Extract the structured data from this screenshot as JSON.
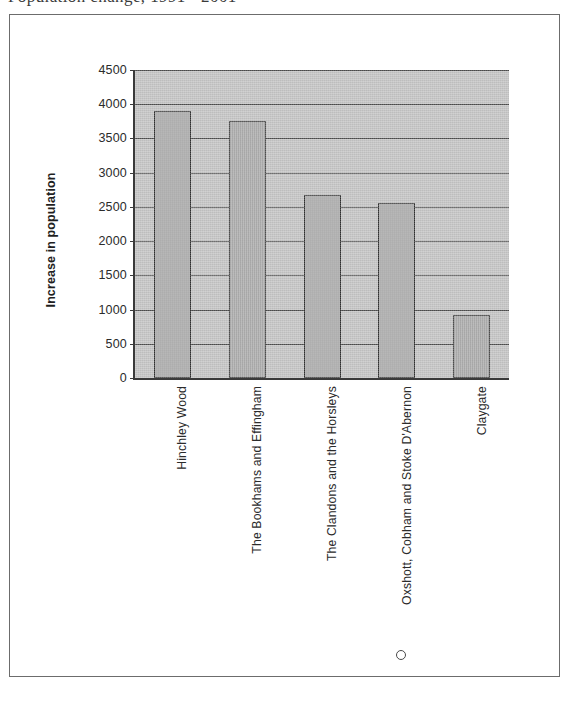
{
  "page": {
    "top_bleed_text": "Population change, 1991 - 2001",
    "scan_speck": "ink-speck"
  },
  "chart_data": {
    "type": "bar",
    "title": "",
    "xlabel": "",
    "ylabel": "Increase in population",
    "categories": [
      "Hinchley Wood",
      "The Bookhams and Effingham",
      "The Clandons and the Horsleys",
      "Oxshott, Cobham and Stoke D'Abernon",
      "Claygate"
    ],
    "values": [
      3900,
      3750,
      2680,
      2560,
      920
    ],
    "ylim": [
      0,
      4500
    ],
    "ytick_step": 500,
    "ytick_labels": [
      "0",
      "500",
      "1000",
      "1500",
      "2000",
      "2500",
      "3000",
      "3500",
      "4000",
      "4500"
    ],
    "ytick_values": [
      0,
      500,
      1000,
      1500,
      2000,
      2500,
      3000,
      3500,
      4000,
      4500
    ],
    "grid": true,
    "grid_orientation": "horizontal",
    "legend": false,
    "legend_position": "none",
    "colors": {
      "bar_fill": "#9e9e9e",
      "bar_outline": "#2f2f2f",
      "plot_background": "#bdbdbd",
      "gridline": "#4a4a4a",
      "axis": "#3a3a3a",
      "text": "#2b2b2b",
      "frame": "#6c6c6c",
      "page_background": "#ffffff"
    }
  }
}
